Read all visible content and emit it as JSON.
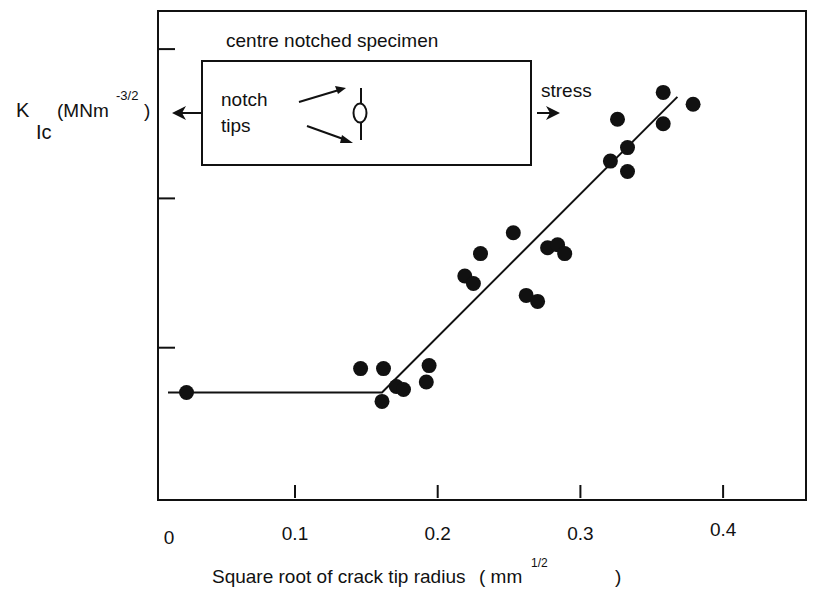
{
  "chart_data": {
    "type": "scatter",
    "title": "",
    "xlabel": "Square root of crack tip radius",
    "xlabel_unit_open": "( mm",
    "xlabel_unit_sup": "1/2",
    "xlabel_unit_close": ")",
    "ylabel": {
      "main": "K",
      "sub": "Ic",
      "unit_open": "(MNm",
      "unit_sup": "-3/2",
      "unit_close": ")"
    },
    "xlim": [
      0,
      0.457
    ],
    "ylim": [
      0,
      3.27
    ],
    "x_ticks": [
      0.1,
      0.2,
      0.3,
      0.4
    ],
    "x_tick_labels": [
      "0",
      "0.1",
      "0.2",
      "0.3",
      "0.4"
    ],
    "y_ticks": [
      1,
      2,
      3
    ],
    "y_tick_labels": [],
    "y_units_note": "arbitrary (unlabelled ticks)",
    "grid": false,
    "marker_color": "#111111",
    "points": [
      {
        "x": 0.024,
        "y": 0.7
      },
      {
        "x": 0.146,
        "y": 0.86
      },
      {
        "x": 0.162,
        "y": 0.86
      },
      {
        "x": 0.161,
        "y": 0.64
      },
      {
        "x": 0.171,
        "y": 0.74
      },
      {
        "x": 0.176,
        "y": 0.72
      },
      {
        "x": 0.192,
        "y": 0.77
      },
      {
        "x": 0.194,
        "y": 0.88
      },
      {
        "x": 0.219,
        "y": 1.48
      },
      {
        "x": 0.225,
        "y": 1.43
      },
      {
        "x": 0.23,
        "y": 1.63
      },
      {
        "x": 0.253,
        "y": 1.77
      },
      {
        "x": 0.262,
        "y": 1.35
      },
      {
        "x": 0.27,
        "y": 1.31
      },
      {
        "x": 0.277,
        "y": 1.67
      },
      {
        "x": 0.284,
        "y": 1.69
      },
      {
        "x": 0.289,
        "y": 1.63
      },
      {
        "x": 0.321,
        "y": 2.25
      },
      {
        "x": 0.326,
        "y": 2.53
      },
      {
        "x": 0.333,
        "y": 2.34
      },
      {
        "x": 0.333,
        "y": 2.18
      },
      {
        "x": 0.358,
        "y": 2.71
      },
      {
        "x": 0.358,
        "y": 2.5
      },
      {
        "x": 0.379,
        "y": 2.63
      }
    ],
    "fit_line": [
      {
        "x": 0.011,
        "y": 0.7
      },
      {
        "x": 0.161,
        "y": 0.7
      },
      {
        "x": 0.368,
        "y": 2.68
      }
    ],
    "inset": {
      "title": "centre notched specimen",
      "label_line1": "notch",
      "label_line2": "tips",
      "right_label": "stress"
    }
  }
}
